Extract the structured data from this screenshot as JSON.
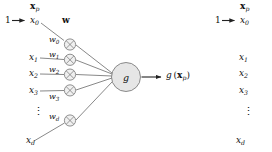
{
  "figure": {
    "type": "neural-network-single-unit-diagram",
    "vector_label": "x",
    "vector_label_sub": "p",
    "weight_vector_label": "w",
    "bias_input_value": "1",
    "activation_node_label": "g",
    "output_label_fn": "g",
    "output_label_arg": "x",
    "output_label_arg_sub": "p",
    "vertical_dots": "⋮",
    "inputs": [
      {
        "label": "x",
        "sub": "0"
      },
      {
        "label": "x",
        "sub": "1"
      },
      {
        "label": "x",
        "sub": "2"
      },
      {
        "label": "x",
        "sub": "3"
      },
      {
        "label": "x",
        "sub": "d"
      }
    ],
    "weights": [
      {
        "label": "w",
        "sub": "0"
      },
      {
        "label": "w",
        "sub": "1"
      },
      {
        "label": "w",
        "sub": "2"
      },
      {
        "label": "w",
        "sub": "3"
      },
      {
        "label": "w",
        "sub": "d"
      }
    ],
    "multiplier_symbol": "⊗",
    "colors": {
      "node_fill": "#e6e6e6",
      "node_stroke": "#6e6e6e",
      "edge": "#555555",
      "text": "#111111",
      "background": "#ffffff"
    }
  },
  "repeat_panel": {
    "vector_label": "x",
    "vector_label_sub": "p",
    "bias_input_value": "1",
    "inputs": [
      {
        "label": "x",
        "sub": "0"
      },
      {
        "label": "x",
        "sub": "1"
      },
      {
        "label": "x",
        "sub": "2"
      },
      {
        "label": "x",
        "sub": "3"
      },
      {
        "label": "x",
        "sub": "d"
      }
    ],
    "vertical_dots": "⋮"
  }
}
